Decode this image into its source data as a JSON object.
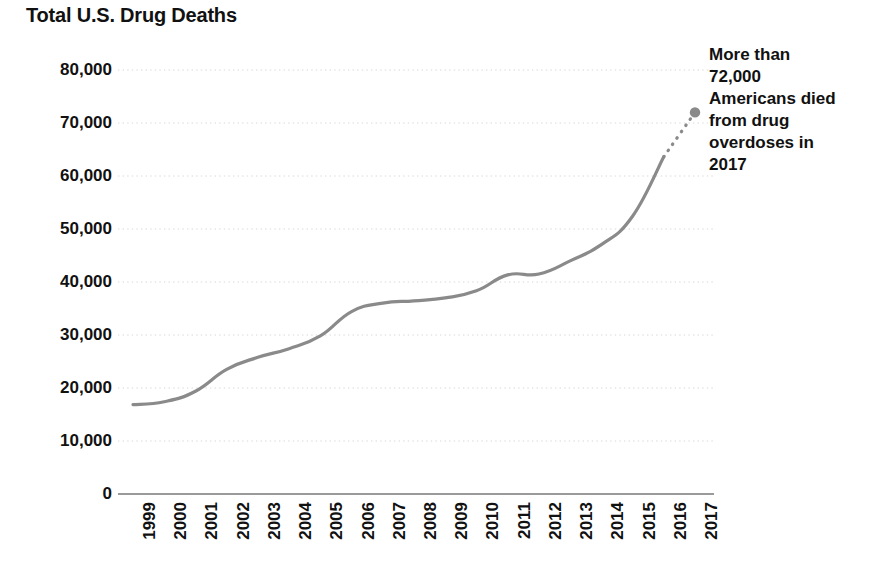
{
  "chart_data": {
    "type": "line",
    "title": "Total U.S. Drug Deaths",
    "xlabel": "",
    "ylabel": "",
    "categories": [
      "1999",
      "2000",
      "2001",
      "2002",
      "2003",
      "2004",
      "2005",
      "2006",
      "2007",
      "2008",
      "2009",
      "2010",
      "2011",
      "2012",
      "2013",
      "2014",
      "2015",
      "2016",
      "2017"
    ],
    "values": [
      16849,
      17415,
      19394,
      23518,
      25785,
      27424,
      29813,
      34425,
      36010,
      36450,
      37004,
      38329,
      41340,
      41502,
      43982,
      47055,
      52404,
      63632,
      72000
    ],
    "ylim": [
      0,
      80000
    ],
    "yticks": [
      0,
      10000,
      20000,
      30000,
      40000,
      50000,
      60000,
      70000,
      80000
    ],
    "ytick_labels": [
      "0",
      "10,000",
      "20,000",
      "30,000",
      "40,000",
      "50,000",
      "60,000",
      "70,000",
      "80,000"
    ],
    "grid": true,
    "grid_style": "dotted",
    "legend": "none",
    "line_color": "#8a8a8a",
    "grid_color": "#d8d8d8",
    "axis_color": "#9a9a9a",
    "dashed_segment": {
      "from_category": "2016",
      "to_category": "2017",
      "style": "dotted",
      "note": "projected / provisional final year"
    },
    "endpoint_marker": {
      "category": "2017",
      "value": 72000,
      "shape": "circle",
      "color": "#8a8a8a"
    },
    "annotations": [
      {
        "text": "More than 72,000 Americans died from drug overdoses in 2017",
        "target_category": "2017",
        "target_value": 72000
      }
    ]
  },
  "annotation": {
    "line1": "More than",
    "line2": "72,000",
    "line3": "Americans died",
    "line4": "from drug",
    "line5": "overdoses in",
    "line6": "2017"
  }
}
